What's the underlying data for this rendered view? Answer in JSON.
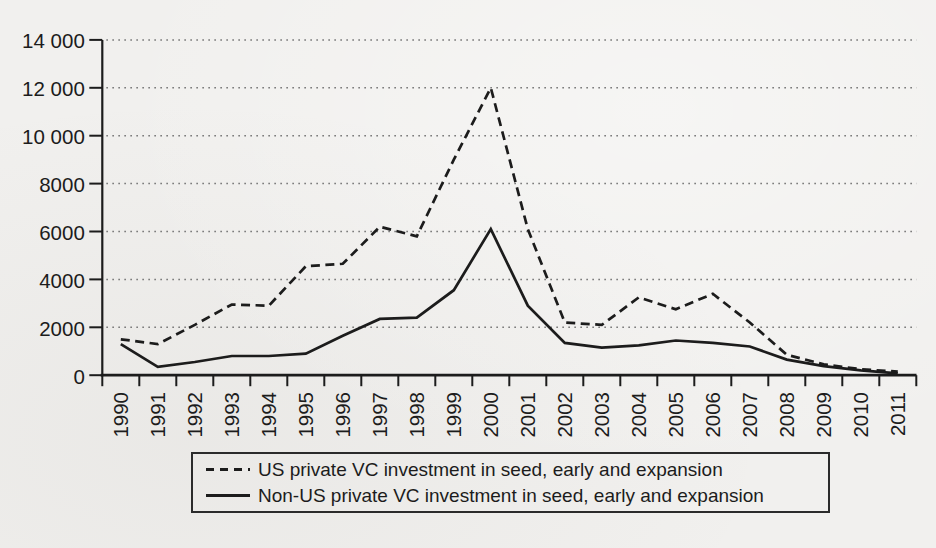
{
  "page": {
    "background_color": "#f1f0ee",
    "ink_color": "#1c1c1c",
    "grid_color": "#7d7d7d"
  },
  "chart_data": {
    "type": "line",
    "title": "",
    "xlabel": "",
    "ylabel": "",
    "ylim": [
      0,
      14000
    ],
    "grid": "dotted horizontal gridlines at every 2000",
    "legend_position": "bottom, boxed",
    "x_tick_labels": [
      "1990",
      "1991",
      "1992",
      "1993",
      "1994",
      "1995",
      "1996",
      "1997",
      "1998",
      "1999",
      "2000",
      "2001",
      "2002",
      "2003",
      "2004",
      "2005",
      "2006",
      "2007",
      "2008",
      "2009",
      "2010",
      "2011"
    ],
    "y_ticks": [
      {
        "value": 0,
        "label": "0"
      },
      {
        "value": 2000,
        "label": "2000"
      },
      {
        "value": 4000,
        "label": "4000"
      },
      {
        "value": 6000,
        "label": "6000"
      },
      {
        "value": 8000,
        "label": "8000"
      },
      {
        "value": 10000,
        "label": "10 000"
      },
      {
        "value": 12000,
        "label": "12 000"
      },
      {
        "value": 14000,
        "label": "14 000"
      }
    ],
    "series": [
      {
        "name": "US private VC investment in seed, early and expansion",
        "style": "dashed",
        "values": [
          1500,
          1300,
          2100,
          2950,
          2900,
          4550,
          4650,
          6200,
          5800,
          9000,
          12000,
          6100,
          2200,
          2100,
          3250,
          2750,
          3400,
          2200,
          850,
          450,
          250,
          150
        ]
      },
      {
        "name": "Non-US private VC investment in seed, early and expansion",
        "style": "solid",
        "values": [
          1300,
          350,
          550,
          800,
          800,
          900,
          1650,
          2350,
          2400,
          3550,
          6100,
          2900,
          1350,
          1150,
          1250,
          1450,
          1350,
          1200,
          650,
          380,
          200,
          80
        ]
      }
    ]
  }
}
